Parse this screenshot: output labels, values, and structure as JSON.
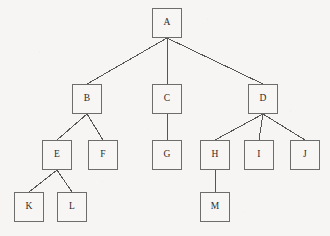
{
  "diagram": {
    "type": "tree",
    "background_color": "#f6f5f3",
    "node_fill_color": "#f7f6f4",
    "node_border_color": "#6d6d6d",
    "edge_color": "#555555",
    "label_color": "#2b2b2b",
    "node_width": 30,
    "node_height": 30,
    "root": "A",
    "levels": [
      [
        "A"
      ],
      [
        "B",
        "C",
        "D"
      ],
      [
        "E",
        "F",
        "G",
        "H",
        "I",
        "J"
      ],
      [
        "K",
        "L",
        "M"
      ]
    ],
    "nodes": [
      {
        "id": "A",
        "label": "A",
        "x": 152,
        "y": 8,
        "w": 30,
        "h": 30,
        "level": 0,
        "parent": null
      },
      {
        "id": "B",
        "label": "B",
        "x": 72,
        "y": 84,
        "w": 30,
        "h": 30,
        "level": 1,
        "parent": "A"
      },
      {
        "id": "C",
        "label": "C",
        "x": 152,
        "y": 84,
        "w": 30,
        "h": 30,
        "level": 1,
        "parent": "A"
      },
      {
        "id": "D",
        "label": "D",
        "x": 248,
        "y": 84,
        "w": 30,
        "h": 30,
        "level": 1,
        "parent": "A"
      },
      {
        "id": "E",
        "label": "E",
        "x": 42,
        "y": 140,
        "w": 30,
        "h": 30,
        "level": 2,
        "parent": "B"
      },
      {
        "id": "F",
        "label": "F",
        "x": 88,
        "y": 140,
        "w": 30,
        "h": 30,
        "level": 2,
        "parent": "B"
      },
      {
        "id": "G",
        "label": "G",
        "x": 152,
        "y": 140,
        "w": 30,
        "h": 30,
        "level": 2,
        "parent": "C"
      },
      {
        "id": "H",
        "label": "H",
        "x": 200,
        "y": 140,
        "w": 30,
        "h": 30,
        "level": 2,
        "parent": "D"
      },
      {
        "id": "I",
        "label": "I",
        "x": 244,
        "y": 140,
        "w": 30,
        "h": 30,
        "level": 2,
        "parent": "D"
      },
      {
        "id": "J",
        "label": "J",
        "x": 290,
        "y": 140,
        "w": 30,
        "h": 30,
        "level": 2,
        "parent": "D"
      },
      {
        "id": "K",
        "label": "K",
        "x": 14,
        "y": 192,
        "w": 30,
        "h": 30,
        "level": 3,
        "parent": "E"
      },
      {
        "id": "L",
        "label": "L",
        "x": 57,
        "y": 192,
        "w": 30,
        "h": 30,
        "level": 3,
        "parent": "E"
      },
      {
        "id": "M",
        "label": "M",
        "x": 200,
        "y": 192,
        "w": 30,
        "h": 30,
        "level": 3,
        "parent": "H"
      }
    ],
    "edges": [
      {
        "from": "A",
        "to": "B"
      },
      {
        "from": "A",
        "to": "C"
      },
      {
        "from": "A",
        "to": "D"
      },
      {
        "from": "B",
        "to": "E"
      },
      {
        "from": "B",
        "to": "F"
      },
      {
        "from": "C",
        "to": "G"
      },
      {
        "from": "D",
        "to": "H"
      },
      {
        "from": "D",
        "to": "I"
      },
      {
        "from": "D",
        "to": "J"
      },
      {
        "from": "E",
        "to": "K"
      },
      {
        "from": "E",
        "to": "L"
      },
      {
        "from": "H",
        "to": "M"
      }
    ]
  }
}
